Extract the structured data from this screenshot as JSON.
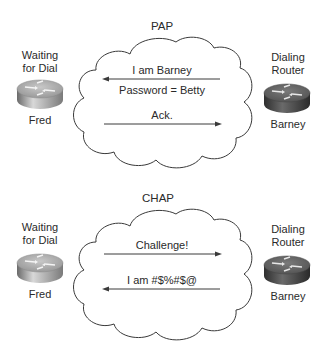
{
  "diagram": {
    "colors": {
      "line": "#3a3a3a",
      "text": "#2a2a2a",
      "router_light_top": "#b8b8b8",
      "router_light_side": "#8a8a8a",
      "router_dark_top": "#6e6e6e",
      "router_dark_side": "#3a3a3a",
      "background": "#ffffff"
    },
    "pap": {
      "title": "PAP",
      "left_node": {
        "role_line1": "Waiting",
        "role_line2": "for Dial",
        "name": "Fred",
        "icon": "router-icon-light"
      },
      "right_node": {
        "role_line1": "Dialing",
        "role_line2": "Router",
        "name": "Barney",
        "icon": "router-icon-dark"
      },
      "messages": [
        {
          "text": "I am Barney",
          "direction": "right-to-left"
        },
        {
          "text": "Password = Betty",
          "direction": "none"
        },
        {
          "text": "Ack.",
          "direction": "left-to-right"
        }
      ]
    },
    "chap": {
      "title": "CHAP",
      "left_node": {
        "role_line1": "Waiting",
        "role_line2": "for Dial",
        "name": "Fred",
        "icon": "router-icon-light"
      },
      "right_node": {
        "role_line1": "Dialing",
        "role_line2": "Router",
        "name": "Barney",
        "icon": "router-icon-dark"
      },
      "messages": [
        {
          "text": "Challenge!",
          "direction": "left-to-right"
        },
        {
          "text": "I am #$%#$@",
          "direction": "right-to-left"
        }
      ]
    }
  }
}
